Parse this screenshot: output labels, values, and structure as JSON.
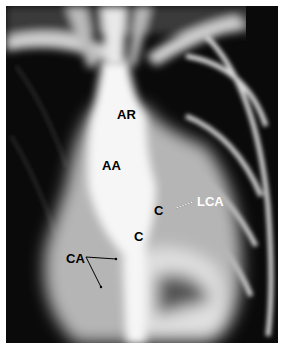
{
  "image": {
    "type": "angiography-radiograph",
    "labels": {
      "ar": "AR",
      "aa": "AA",
      "c1": "C",
      "c2": "C",
      "lca": "LCA",
      "rca": "CA"
    }
  }
}
